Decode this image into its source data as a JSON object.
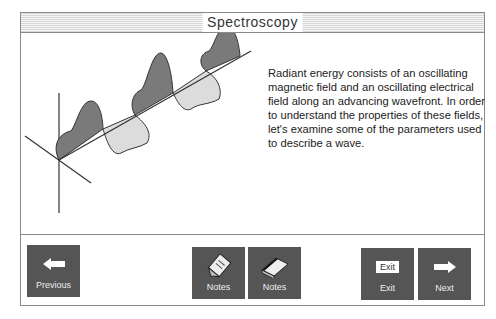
{
  "header": {
    "title": "Spectroscopy"
  },
  "main": {
    "description": "Radiant energy consists of an oscillating magnetic field and an oscillating electrical field along an advancing wavefront. In order to understand the properties of these fields, let's examine some of the parameters used to describe a wave.",
    "illustration": "electromagnetic-wave-diagram",
    "colors": {
      "magnetic": "#777777",
      "electric": "#d9d9d9",
      "outline": "#333333"
    }
  },
  "toolbar": {
    "previous": {
      "label": "Previous",
      "icon": "arrow-left-icon"
    },
    "notes1": {
      "label": "Notes",
      "icon": "notepad-pencil-icon"
    },
    "notes2": {
      "label": "Notes",
      "icon": "notebook-icon"
    },
    "exit": {
      "label": "Exit",
      "icon_text": "Exit"
    },
    "next": {
      "label": "Next",
      "icon": "arrow-right-icon"
    }
  }
}
